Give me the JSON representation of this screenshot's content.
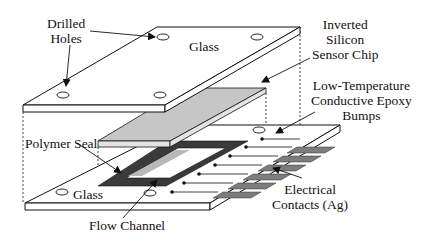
{
  "diagram": {
    "type": "exploded-assembly",
    "colors": {
      "outline": "#111111",
      "glass_fill": "#ffffff",
      "chip_top": "#c8c8c8",
      "chip_side": "#e2e2e2",
      "seal": "#3a3a3a",
      "channel": "#b8b8b8",
      "contacts": "#7a7a7a"
    },
    "components": [
      {
        "id": "top-glass",
        "label": "Glass"
      },
      {
        "id": "sensor-chip",
        "label": "Inverted Silicon Sensor Chip"
      },
      {
        "id": "epoxy-bumps",
        "label": "Low-Temperature Conductive Epoxy Bumps"
      },
      {
        "id": "polymer-seal",
        "label": "Polymer Seal"
      },
      {
        "id": "flow-channel",
        "label": "Flow Channel"
      },
      {
        "id": "electrical-contacts",
        "label": "Electrical Contacts (Ag)"
      },
      {
        "id": "bottom-glass",
        "label": "Glass"
      },
      {
        "id": "drilled-holes",
        "label": "Drilled Holes"
      }
    ]
  },
  "labels": {
    "drilled_holes": [
      "Drilled",
      "Holes"
    ],
    "top_glass": "Glass",
    "sensor_chip": [
      "Inverted",
      "Silicon",
      "Sensor Chip"
    ],
    "epoxy_bumps": [
      "Low-Temperature",
      "Conductive Epoxy",
      "Bumps"
    ],
    "polymer_seal": "Polymer Seal",
    "bottom_glass": "Glass",
    "flow_channel": "Flow Channel",
    "electrical_contacts": [
      "Electrical",
      "Contacts (Ag)"
    ]
  }
}
